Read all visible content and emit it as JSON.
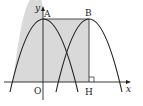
{
  "diagram": {
    "labels": {
      "y_axis": "y",
      "x_axis": "x",
      "origin": "O",
      "point_a": "A",
      "point_b": "B",
      "point_h": "H"
    },
    "colors": {
      "stroke": "#222222",
      "shade": "#d9d9d9",
      "background": "#ffffff"
    }
  }
}
